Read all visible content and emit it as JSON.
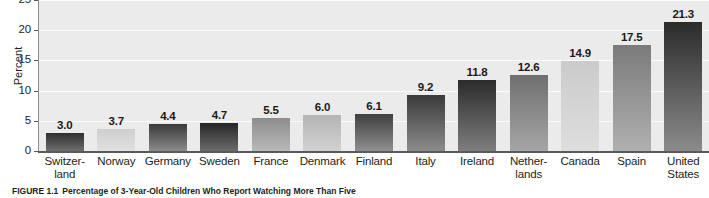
{
  "chart_data": {
    "type": "bar",
    "title": "",
    "xlabel": "",
    "ylabel": "Percent",
    "ylim": [
      0,
      25
    ],
    "yticks": [
      0,
      5,
      10,
      15,
      20,
      25
    ],
    "grid": true,
    "legend": "none",
    "categories": [
      "Switzer-\nland",
      "Norway",
      "Germany",
      "Sweden",
      "France",
      "Denmark",
      "Finland",
      "Italy",
      "Ireland",
      "Nether-\nlands",
      "Canada",
      "Spain",
      "United\nStates"
    ],
    "values": [
      3.0,
      3.7,
      4.4,
      4.7,
      5.5,
      6.0,
      6.1,
      9.2,
      11.8,
      12.6,
      14.9,
      17.5,
      21.3
    ],
    "value_labels": [
      "3.0",
      "3.7",
      "4.4",
      "4.7",
      "5.5",
      "6.0",
      "6.1",
      "9.2",
      "11.8",
      "12.6",
      "14.9",
      "17.5",
      "21.3"
    ],
    "bar_colors_top": [
      "#2e2e2e",
      "#cfcfcf",
      "#3b3b3b",
      "#262626",
      "#8d8d8d",
      "#b4b4b4",
      "#3f3f3f",
      "#3a3a3a",
      "#2b2b2b",
      "#6f6f6f",
      "#cbcbcb",
      "#7b7b7b",
      "#2b2b2b"
    ],
    "bar_colors_bottom": [
      "#6e6e6e",
      "#e0e0e0",
      "#8a8a8a",
      "#6b6b6b",
      "#b9b9b9",
      "#d2d2d2",
      "#8f8f8f",
      "#8c8c8c",
      "#7e7e7e",
      "#a6a6a6",
      "#dedede",
      "#b0b0b0",
      "#8b8b8b"
    ]
  },
  "axes": {
    "ylabel": "Percent",
    "ytick_labels": [
      "0",
      "5",
      "10",
      "15",
      "20",
      "25"
    ]
  },
  "caption": {
    "number": "FIGURE 1.1",
    "text": "Percentage of 3-Year-Old Children Who Report Watching More Than Five"
  },
  "colors": {
    "plot_background": "#ebebeb",
    "gridline": "#fbfbfb",
    "axis": "#5a5a5c",
    "text": "#231f20"
  }
}
